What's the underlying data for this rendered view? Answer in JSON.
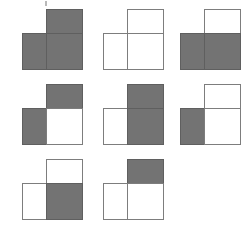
{
  "figure": {
    "type": "shape-grid",
    "colors": {
      "filled": "#737373",
      "unfilled": "#ffffff",
      "outline": "#7d7d7d",
      "background": "#ffffff"
    },
    "grid": {
      "columns": 3,
      "rows": 3,
      "column_x": [
        22,
        103,
        180
      ],
      "row_y": [
        9,
        84,
        159
      ],
      "occupied_cells": 8,
      "empty_cells": 1
    },
    "cell_order": [
      "top-right",
      "bottom-left",
      "bottom-right"
    ],
    "shapes": [
      {
        "index": 1,
        "name": "tromino-1",
        "position": {
          "column": 1,
          "row": 1
        },
        "top_right": "filled",
        "bottom_left": "filled",
        "bottom_right": "filled",
        "filled_count": 3
      },
      {
        "index": 2,
        "name": "tromino-2",
        "position": {
          "column": 2,
          "row": 1
        },
        "top_right": "unfilled",
        "bottom_left": "unfilled",
        "bottom_right": "unfilled",
        "filled_count": 0
      },
      {
        "index": 3,
        "name": "tromino-3",
        "position": {
          "column": 3,
          "row": 1
        },
        "top_right": "unfilled",
        "bottom_left": "filled",
        "bottom_right": "filled",
        "filled_count": 2
      },
      {
        "index": 4,
        "name": "tromino-4",
        "position": {
          "column": 1,
          "row": 2
        },
        "top_right": "filled",
        "bottom_left": "filled",
        "bottom_right": "unfilled",
        "filled_count": 2
      },
      {
        "index": 5,
        "name": "tromino-5",
        "position": {
          "column": 2,
          "row": 2
        },
        "top_right": "filled",
        "bottom_left": "unfilled",
        "bottom_right": "filled",
        "filled_count": 2
      },
      {
        "index": 6,
        "name": "tromino-6",
        "position": {
          "column": 3,
          "row": 2
        },
        "top_right": "unfilled",
        "bottom_left": "filled",
        "bottom_right": "unfilled",
        "filled_count": 1
      },
      {
        "index": 7,
        "name": "tromino-7",
        "position": {
          "column": 1,
          "row": 3
        },
        "top_right": "unfilled",
        "bottom_left": "unfilled",
        "bottom_right": "filled",
        "filled_count": 1
      },
      {
        "index": 8,
        "name": "tromino-8",
        "position": {
          "column": 2,
          "row": 3
        },
        "top_right": "filled",
        "bottom_left": "unfilled",
        "bottom_right": "unfilled",
        "filled_count": 1
      }
    ]
  }
}
